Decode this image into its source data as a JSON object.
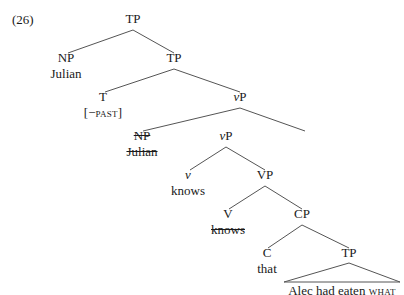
{
  "example_number": "(26)",
  "tree": {
    "root": {
      "cat": "TP"
    },
    "subject": {
      "cat": "NP",
      "word": "Julian"
    },
    "tp2": {
      "cat": "TP"
    },
    "t": {
      "cat": "T",
      "feature": "[−PAST]",
      "feature_prefix": "[−",
      "feature_sc": "past",
      "feature_suffix": "]"
    },
    "vp1": {
      "cat_v": "v",
      "cat_p": "P"
    },
    "subject_copy": {
      "cat": "NP",
      "word": "Julian",
      "struck": true
    },
    "vp2": {
      "cat_v": "v",
      "cat_p": "P"
    },
    "little_v": {
      "cat": "v",
      "word": "knows"
    },
    "VP": {
      "cat": "VP"
    },
    "V": {
      "cat": "V",
      "word": "knows",
      "struck": true
    },
    "CP": {
      "cat": "CP"
    },
    "C": {
      "cat": "C",
      "word": "that"
    },
    "tp3": {
      "cat": "TP",
      "terminal_prefix": "Alec had eaten ",
      "terminal_sc": "what"
    }
  }
}
